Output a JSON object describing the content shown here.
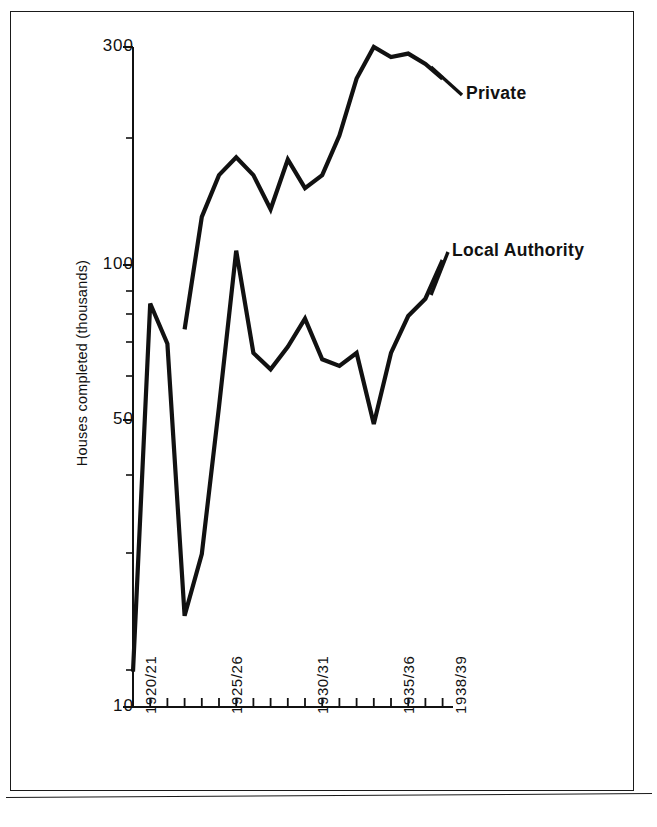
{
  "figure": {
    "frame": "scanned-page-border"
  },
  "chart_data": {
    "type": "line",
    "title": "",
    "subtitle": "",
    "xlabel": "",
    "ylabel": "Houses completed (thousands)",
    "yscale": "log",
    "ylim": [
      10,
      320
    ],
    "grid": false,
    "legend_position": "inline-annotations",
    "ytick_labels": [
      "300",
      "100",
      "50",
      "10"
    ],
    "ytick_values": [
      300,
      100,
      50,
      10
    ],
    "yminor_ticks": [
      200,
      90,
      80,
      70,
      60,
      40,
      30,
      20
    ],
    "categories": [
      "1920/21",
      "1921/22",
      "1922/23",
      "1923/24",
      "1924/25",
      "1925/26",
      "1926/27",
      "1927/28",
      "1928/29",
      "1929/30",
      "1930/31",
      "1931/32",
      "1932/33",
      "1933/34",
      "1934/35",
      "1935/36",
      "1936/37",
      "1937/38",
      "1938/39"
    ],
    "xtick_labels": [
      "1920/21",
      "1925/26",
      "1930/31",
      "1935/36",
      "1938/39"
    ],
    "xtick_label_indices": [
      0,
      5,
      10,
      15,
      18
    ],
    "series": [
      {
        "name": "Private",
        "annotation": "Private",
        "start_index": 3,
        "values": [
          null,
          null,
          null,
          70,
          125,
          155,
          170,
          155,
          130,
          168,
          145,
          155,
          190,
          255,
          300,
          285,
          290,
          275,
          255
        ]
      },
      {
        "name": "Local Authority",
        "annotation": "Local Authority",
        "start_index": 0,
        "values": [
          12,
          80,
          65,
          16,
          22,
          47,
          105,
          62,
          57,
          64,
          74,
          60,
          58,
          62,
          43,
          62,
          75,
          82,
          100
        ]
      }
    ]
  },
  "annotations": {
    "private_label": "Private",
    "local_authority_label": "Local Authority"
  }
}
